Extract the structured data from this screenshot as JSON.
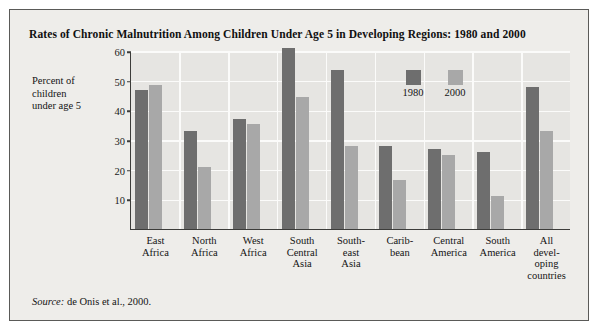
{
  "figure": {
    "title": "Rates of Chronic Malnutrition Among Children Under Age 5 in Developing Regions: 1980 and 2000",
    "source_word": "Source:",
    "source_text": " de Onis et al., 2000.",
    "ylabel_line1": "Percent of",
    "ylabel_line2": "children",
    "ylabel_line3": "under age 5"
  },
  "legend": {
    "items": [
      {
        "label": "1980",
        "color": "#6e6e6e"
      },
      {
        "label": "2000",
        "color": "#a8a8a8"
      }
    ]
  },
  "chart_data": {
    "type": "bar",
    "title": "Rates of Chronic Malnutrition Among Children Under Age 5 in Developing Regions: 1980 and 2000",
    "xlabel": "",
    "ylabel": "Percent of children under age 5",
    "ylim": [
      0,
      60
    ],
    "yticks": [
      10,
      20,
      30,
      40,
      50,
      60
    ],
    "ytick_labels": [
      "10",
      "20",
      "30",
      "40",
      "50",
      "60"
    ],
    "grid": "horizontal-and-vertical",
    "legend_position": "inside-upper-right",
    "categories": [
      "East Africa",
      "North Africa",
      "West Africa",
      "South Central Asia",
      "Southeast Asia",
      "Caribbean",
      "Central America",
      "South America",
      "All developing countries"
    ],
    "category_label_lines": [
      [
        "East",
        "Africa"
      ],
      [
        "North",
        "Africa"
      ],
      [
        "West",
        "Africa"
      ],
      [
        "South",
        "Central",
        "Asia"
      ],
      [
        "South-",
        "east",
        "Asia"
      ],
      [
        "Carib-",
        "bean"
      ],
      [
        "Central",
        "America"
      ],
      [
        "South",
        "America"
      ],
      [
        "All",
        "devel-",
        "oping",
        "countries"
      ]
    ],
    "series": [
      {
        "name": "1980",
        "color": "#6e6e6e",
        "values": [
          47,
          33,
          37,
          61,
          53.5,
          28,
          27,
          26,
          48
        ]
      },
      {
        "name": "2000",
        "color": "#a8a8a8",
        "values": [
          48.5,
          21,
          35.5,
          44.5,
          28,
          16.5,
          25,
          11,
          33
        ]
      }
    ]
  }
}
